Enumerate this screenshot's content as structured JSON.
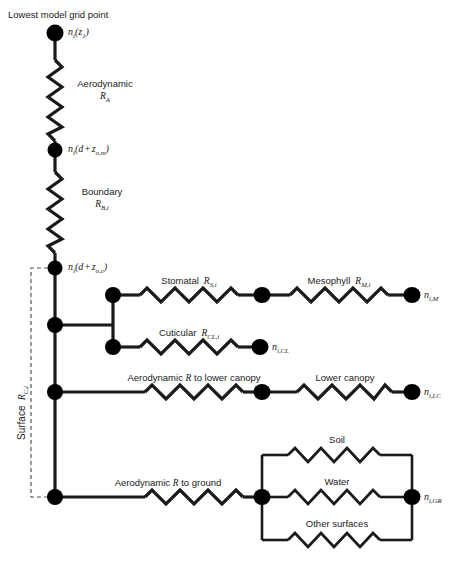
{
  "diagram": {
    "title_note": "Lowest model grid point",
    "bracket_label": "Surface",
    "bracket_label_sub": "R",
    "bracket_label_sub2": "C,i",
    "colors": {
      "line": "#1a1a1a",
      "node": "#000000",
      "background": "#ffffff",
      "dashed": "#555555"
    }
  },
  "nodes": {
    "top": {
      "label_base": "n",
      "label_sub_i": "i",
      "label_arg": "(z",
      "label_arg_sub": "1",
      "label_close": ")",
      "full": "n_i(z_1)"
    },
    "second": {
      "full": "n_i(d + z_o,m)"
    },
    "third": {
      "full": "n_i(d + z_o,c)"
    },
    "mesophyll_end": {
      "full": "n_i,M"
    },
    "cuticular_end": {
      "full": "n_i,CL"
    },
    "lower_canopy_end": {
      "full": "n_i,LC"
    },
    "ground_end": {
      "full": "n_i,GR"
    }
  },
  "resistors": {
    "aerodynamic_RA": {
      "name": "Aerodynamic",
      "symbol": "R",
      "sub": "A"
    },
    "boundary_RB": {
      "name": "Boundary",
      "symbol": "R",
      "sub": "B,i"
    },
    "stomatal": {
      "name": "Stomatal",
      "symbol": "R",
      "sub": "S,i"
    },
    "mesophyll": {
      "name": "Mesophyll",
      "symbol": "R",
      "sub": "M,i"
    },
    "cuticular": {
      "name": "Cuticular",
      "symbol": "R",
      "sub": "CL,i"
    },
    "aero_lower_canopy": {
      "prefix": "Aerodynamic ",
      "symbol": "R",
      "suffix": " to lower canopy"
    },
    "lower_canopy": {
      "name": "Lower canopy"
    },
    "aero_ground": {
      "prefix": "Aerodynamic ",
      "symbol": "R",
      "suffix": " to ground"
    },
    "soil": {
      "name": "Soil"
    },
    "water": {
      "name": "Water"
    },
    "other_surfaces": {
      "name": "Other surfaces"
    }
  }
}
